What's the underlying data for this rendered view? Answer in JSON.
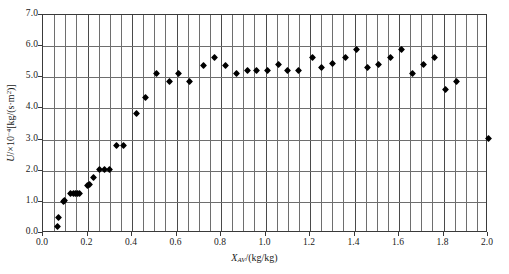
{
  "chart_data": {
    "type": "scatter",
    "title": "",
    "xlabel": "X_AV/(kg/kg)",
    "ylabel": "U/×10⁻⁴[kg/(s·m²)]",
    "xlim": [
      0.0,
      2.0
    ],
    "ylim": [
      0.0,
      7.0
    ],
    "xticks": [
      "0.0",
      "0.2",
      "0.4",
      "0.6",
      "0.8",
      "1.0",
      "1.2",
      "1.4",
      "1.6",
      "1.8",
      "2.0"
    ],
    "xtick_values": [
      0.0,
      0.2,
      0.4,
      0.6,
      0.8,
      1.0,
      1.2,
      1.4,
      1.6,
      1.8,
      2.0
    ],
    "yticks": [
      "0.0",
      "1.0",
      "2.0",
      "3.0",
      "4.0",
      "5.0",
      "6.0",
      "7.0"
    ],
    "ytick_values": [
      0.0,
      1.0,
      2.0,
      3.0,
      4.0,
      5.0,
      6.0,
      7.0
    ],
    "x_minor_step": 0.05,
    "grid": "major horizontal, minor vertical",
    "legend": "none",
    "marker": "filled black diamond",
    "series": [
      {
        "name": "U",
        "points": [
          [
            0.065,
            0.22
          ],
          [
            0.07,
            0.5
          ],
          [
            0.09,
            1.0
          ],
          [
            0.095,
            1.03
          ],
          [
            0.125,
            1.28
          ],
          [
            0.135,
            1.28
          ],
          [
            0.145,
            1.28
          ],
          [
            0.155,
            1.28
          ],
          [
            0.165,
            1.28
          ],
          [
            0.2,
            1.53
          ],
          [
            0.21,
            1.55
          ],
          [
            0.225,
            1.78
          ],
          [
            0.255,
            2.03
          ],
          [
            0.275,
            2.03
          ],
          [
            0.3,
            2.03
          ],
          [
            0.33,
            2.82
          ],
          [
            0.36,
            2.82
          ],
          [
            0.42,
            3.85
          ],
          [
            0.46,
            4.35
          ],
          [
            0.51,
            5.12
          ],
          [
            0.57,
            4.87
          ],
          [
            0.61,
            5.12
          ],
          [
            0.66,
            4.87
          ],
          [
            0.72,
            5.38
          ],
          [
            0.77,
            5.62
          ],
          [
            0.82,
            5.38
          ],
          [
            0.87,
            5.12
          ],
          [
            0.92,
            5.22
          ],
          [
            0.96,
            5.22
          ],
          [
            1.01,
            5.22
          ],
          [
            1.06,
            5.42
          ],
          [
            1.1,
            5.22
          ],
          [
            1.15,
            5.22
          ],
          [
            1.21,
            5.62
          ],
          [
            1.25,
            5.32
          ],
          [
            1.3,
            5.45
          ],
          [
            1.36,
            5.62
          ],
          [
            1.41,
            5.9
          ],
          [
            1.46,
            5.32
          ],
          [
            1.51,
            5.42
          ],
          [
            1.56,
            5.62
          ],
          [
            1.61,
            5.88
          ],
          [
            1.66,
            5.12
          ],
          [
            1.71,
            5.42
          ],
          [
            1.76,
            5.62
          ],
          [
            1.81,
            4.6
          ],
          [
            1.86,
            4.85
          ],
          [
            2.0,
            3.05
          ]
        ]
      }
    ]
  },
  "axes": {
    "y_title_parts": {
      "symbol": "U",
      "slash": "/",
      "factor": "×10",
      "exponent": "−4",
      "unit": "[kg/(s·m",
      "unit_exp": "2",
      "unit_close": ")]"
    },
    "x_title_parts": {
      "symbol": "X",
      "subscript": "AV",
      "unit": "/(kg/kg)"
    }
  }
}
